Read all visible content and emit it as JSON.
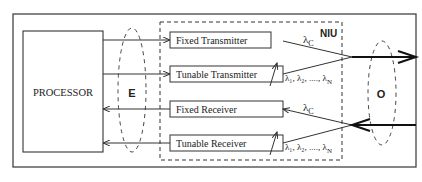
{
  "diagram": {
    "processor_label": "PROCESSOR",
    "niu_label": "NIU",
    "electrical_interface_label": "E",
    "optical_interface_label": "O",
    "blocks": [
      {
        "id": "fixed-transmitter",
        "label": "Fixed Transmitter"
      },
      {
        "id": "tunable-transmitter",
        "label": "Tunable Transmitter"
      },
      {
        "id": "fixed-receiver",
        "label": "Fixed Receiver"
      },
      {
        "id": "tunable-receiver",
        "label": "Tunable Receiver"
      }
    ],
    "wavelength_labels": {
      "fixed_tx": "λ",
      "fixed_tx_sub": "C",
      "tunable_tx": "λ₁, λ₂, ...., λ",
      "tunable_tx_sub": "N",
      "fixed_rx": "λ",
      "fixed_rx_sub": "C",
      "tunable_rx": "λ₁, λ₂, ...., λ",
      "tunable_rx_sub": "N"
    }
  }
}
